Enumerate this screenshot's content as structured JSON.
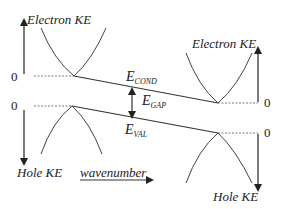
{
  "diagram": {
    "type": "band_diagram",
    "labels": {
      "electron_ke_left": "Electron  KE",
      "electron_ke_right": "Electron  KE",
      "hole_ke_left": "Hole  KE",
      "hole_ke_right": "Hole  KE",
      "wavenumber": "wavenumber",
      "zero": "0",
      "e_cond_main": "E",
      "e_cond_sub": "COND",
      "e_gap_main": "E",
      "e_gap_sub": "GAP",
      "e_val_main": "E",
      "e_val_sub": "VAL"
    },
    "colors": {
      "line": "#333333",
      "text": "#222222",
      "background": "#ffffff"
    }
  }
}
